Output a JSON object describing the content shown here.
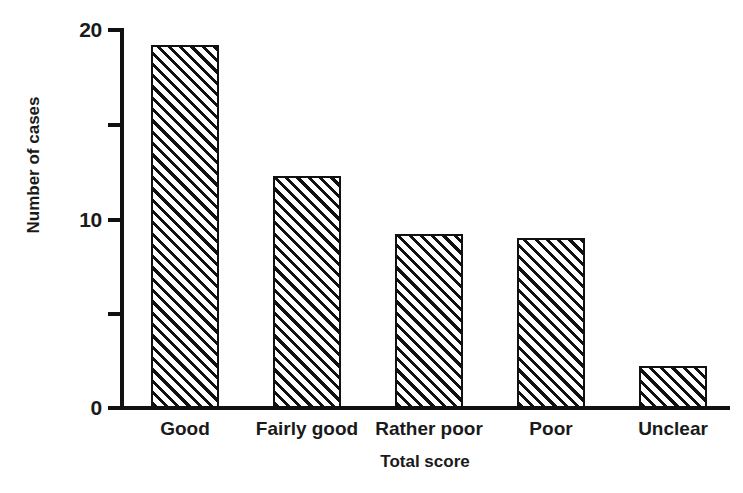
{
  "chart_data": {
    "type": "bar",
    "title": "",
    "xlabel": "Total score",
    "ylabel": "Number of cases",
    "categories": [
      "Good",
      "Fairly good",
      "Rather poor",
      "Poor",
      "Unclear"
    ],
    "values": [
      19.2,
      12.3,
      9.2,
      9.0,
      2.2
    ],
    "ylim": [
      0,
      20
    ],
    "yticks": [
      0,
      5,
      10,
      15,
      20
    ],
    "ytick_labels": [
      "0",
      "",
      "10",
      "",
      "20"
    ],
    "grid": false,
    "legend": null,
    "bar_style": {
      "fill": "diagonal-hatch",
      "hatch_color": "#111111",
      "background": "#ffffff",
      "edge_color": "#111111"
    }
  },
  "axis": {
    "y_label": "Number of cases",
    "x_label": "Total score",
    "y_tick_0": "0",
    "y_tick_10": "10",
    "y_tick_20": "20"
  },
  "bars": [
    {
      "label": "Good",
      "value": 19.2
    },
    {
      "label": "Fairly good",
      "value": 12.3
    },
    {
      "label": "Rather poor",
      "value": 9.2
    },
    {
      "label": "Poor",
      "value": 9.0
    },
    {
      "label": "Unclear",
      "value": 2.2
    }
  ]
}
